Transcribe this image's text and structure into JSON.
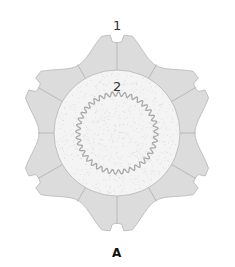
{
  "diagram": {
    "labels": {
      "outer": "1",
      "inner": "2"
    },
    "caption": "A",
    "geometry": {
      "center": [
        117,
        133
      ],
      "outer_radius": 100,
      "inner_radius": 63,
      "wavy_radius": 39,
      "wavy_amplitude": 2.2,
      "wave_count": 40,
      "cell_count": 12,
      "notch_count": 6
    },
    "colors": {
      "cell_fill": "#dcdcdc",
      "cell_stroke": "#b4b4b4",
      "center_fill": "#f4f4f4",
      "speckle": "#d6d6d6",
      "wavy_line": "#a8a8a8"
    }
  }
}
